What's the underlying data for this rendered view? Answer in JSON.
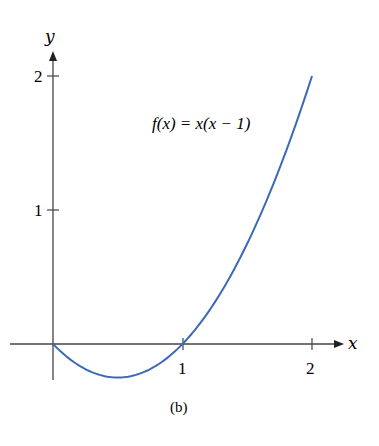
{
  "chart_data": {
    "type": "line",
    "title": "",
    "caption": "(b)",
    "xlabel": "x",
    "ylabel": "y",
    "xlim": [
      -0.05,
      2.2
    ],
    "ylim": [
      -0.25,
      2.2
    ],
    "xticks": [
      1,
      2
    ],
    "yticks": [
      1,
      2
    ],
    "xtick_labels": [
      "1",
      "2"
    ],
    "ytick_labels": [
      "1",
      "2"
    ],
    "grid": false,
    "annotations": [
      {
        "text": "f(x) = x(x − 1)",
        "x": 1.45,
        "y": 1.6
      }
    ],
    "series": [
      {
        "name": "f(x) = x(x − 1)",
        "color": "#3b69b8",
        "x": [
          0,
          0.25,
          0.5,
          0.75,
          1,
          1.25,
          1.5,
          1.75,
          2
        ],
        "y": [
          0,
          -0.1875,
          -0.25,
          -0.1875,
          0,
          0.3125,
          0.75,
          1.3125,
          2
        ]
      }
    ]
  },
  "labels": {
    "x_axis": "x",
    "y_axis": "y",
    "x_tick_1": "1",
    "x_tick_2": "2",
    "y_tick_1": "1",
    "y_tick_2": "2",
    "function_label": "f(x) = x(x − 1)",
    "caption": "(b)"
  },
  "colors": {
    "curve": "#3b69b8",
    "axis": "#333333"
  }
}
